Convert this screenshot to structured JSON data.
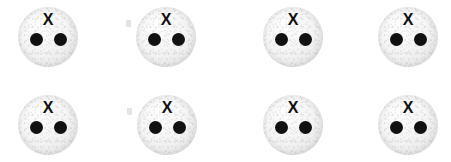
{
  "canvas": {
    "width": 451,
    "height": 162,
    "background_color": "#ffffff"
  },
  "style": {
    "token_fill_color": "#f1f1f1",
    "token_edge_color": "#cfcfcf",
    "dot_color": "#111111",
    "label_color": "#111111",
    "token_diameter": 60,
    "dot_diameter": 13
  },
  "grid": {
    "rows": 2,
    "columns": 4,
    "total_tokens": 8
  },
  "tokens": [
    {
      "id": "token-r1c1",
      "label": "X",
      "dot_count": 2,
      "row": 1,
      "column": 1,
      "x": 18,
      "y": 7
    },
    {
      "id": "token-r1c2",
      "label": "X",
      "dot_count": 2,
      "row": 1,
      "column": 2,
      "x": 136,
      "y": 7
    },
    {
      "id": "token-r1c3",
      "label": "X",
      "dot_count": 2,
      "row": 1,
      "column": 3,
      "x": 263,
      "y": 7
    },
    {
      "id": "token-r1c4",
      "label": "X",
      "dot_count": 2,
      "row": 1,
      "column": 4,
      "x": 378,
      "y": 7
    },
    {
      "id": "token-r2c1",
      "label": "X",
      "dot_count": 2,
      "row": 2,
      "column": 1,
      "x": 18,
      "y": 95
    },
    {
      "id": "token-r2c2",
      "label": "X",
      "dot_count": 2,
      "row": 2,
      "column": 2,
      "x": 137,
      "y": 95
    },
    {
      "id": "token-r2c3",
      "label": "X",
      "dot_count": 2,
      "row": 2,
      "column": 3,
      "x": 263,
      "y": 95
    },
    {
      "id": "token-r2c4",
      "label": "X",
      "dot_count": 2,
      "row": 2,
      "column": 4,
      "x": 378,
      "y": 95
    }
  ],
  "artifacts": [
    {
      "id": "speck-1",
      "x": 126,
      "y": 20
    },
    {
      "id": "speck-2",
      "x": 127,
      "y": 108
    }
  ]
}
